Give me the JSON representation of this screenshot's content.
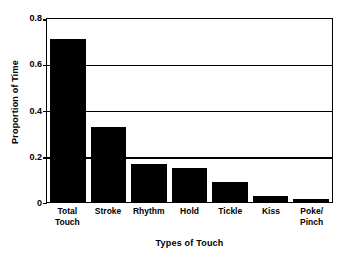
{
  "chart_data": {
    "type": "bar",
    "title": "",
    "xlabel": "Types of Touch",
    "ylabel": "Proportion of Time",
    "categories": [
      "Total\nTouch",
      "Stroke",
      "Rhythm",
      "Hold",
      "Tickle",
      "Kiss",
      "Poke/\nPinch"
    ],
    "values": [
      0.705,
      0.325,
      0.165,
      0.147,
      0.085,
      0.027,
      0.015
    ],
    "ylim": [
      0,
      0.8
    ],
    "yticks": [
      0,
      0.2,
      0.4,
      0.6,
      0.8
    ],
    "ytick_labels": [
      "0",
      "0.2",
      "0.4",
      "0.6",
      "0.8"
    ],
    "grid": true,
    "grid_axis": "y",
    "legend": "none",
    "bar_color": "#000000",
    "background_color": "#ffffff",
    "axis_color": "#000000"
  }
}
